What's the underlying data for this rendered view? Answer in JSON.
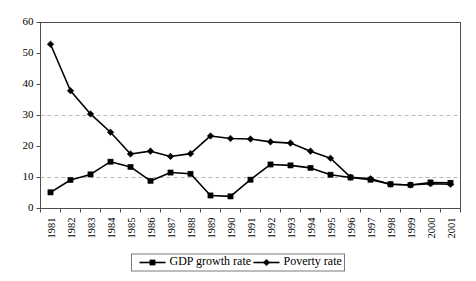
{
  "chart_data": {
    "type": "line",
    "title": "",
    "xlabel": "",
    "ylabel": "",
    "ylim": [
      0,
      60
    ],
    "yticks": [
      0,
      10,
      20,
      30,
      40,
      50,
      60
    ],
    "gridlines": [
      10,
      30
    ],
    "grid": true,
    "legend_position": "bottom-center",
    "categories": [
      "1981",
      "1982",
      "1983",
      "1984",
      "1985",
      "1986",
      "1987",
      "1988",
      "1989",
      "1990",
      "1991",
      "1992",
      "1993",
      "1994",
      "1995",
      "1996",
      "1997",
      "1998",
      "1999",
      "2000",
      "2001"
    ],
    "series": [
      {
        "name": "GDP growth rate",
        "marker": "square",
        "values": [
          5.2,
          9.2,
          11.0,
          15.1,
          13.4,
          8.9,
          11.6,
          11.2,
          4.2,
          3.9,
          9.3,
          14.2,
          13.9,
          13.1,
          10.9,
          10.0,
          9.3,
          7.8,
          7.6,
          8.4,
          8.3
        ]
      },
      {
        "name": "Poverty rate",
        "marker": "diamond",
        "values": [
          53.0,
          38.0,
          30.5,
          24.6,
          17.6,
          18.5,
          16.8,
          17.7,
          23.4,
          22.6,
          22.4,
          21.5,
          21.1,
          18.5,
          16.2,
          10.1,
          9.6,
          7.8,
          7.6,
          8.0,
          7.8
        ]
      }
    ]
  },
  "legend": {
    "items": [
      {
        "label": "GDP growth rate",
        "marker": "square"
      },
      {
        "label": "Poverty rate",
        "marker": "diamond"
      }
    ]
  }
}
